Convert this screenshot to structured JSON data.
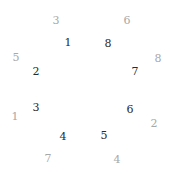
{
  "inner_ring": {
    "color": "#2a2a2a",
    "items": [
      {
        "label": "1",
        "x": 68,
        "y": 42
      },
      {
        "label": "8",
        "x": 108,
        "y": 43
      },
      {
        "label": "2",
        "x": 36,
        "y": 71
      },
      {
        "label": "7",
        "x": 135,
        "y": 71
      },
      {
        "label": "3",
        "x": 36,
        "y": 107
      },
      {
        "label": "6",
        "x": 130,
        "y": 109
      },
      {
        "label": "4",
        "x": 63,
        "y": 136
      },
      {
        "label": "5",
        "x": 104,
        "y": 135
      }
    ]
  },
  "outer_ring": {
    "color": "#a8a8a8",
    "items": [
      {
        "label": "3",
        "x": 56,
        "y": 20
      },
      {
        "label": "6",
        "x": 127,
        "y": 20
      },
      {
        "label": "5",
        "x": 16,
        "y": 57
      },
      {
        "label": "8",
        "x": 158,
        "y": 58
      },
      {
        "label": "1",
        "x": 15,
        "y": 116
      },
      {
        "label": "2",
        "x": 154,
        "y": 123
      },
      {
        "label": "7",
        "x": 48,
        "y": 158
      },
      {
        "label": "4",
        "x": 117,
        "y": 159
      }
    ]
  }
}
